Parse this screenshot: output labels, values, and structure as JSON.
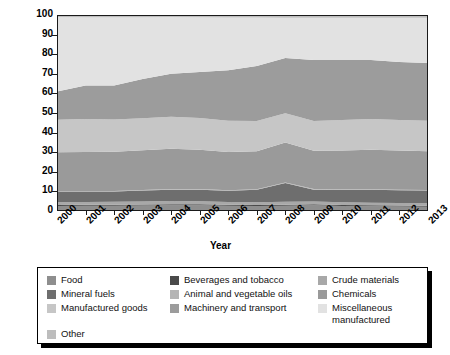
{
  "chart_data": {
    "type": "area",
    "title": "",
    "subtitle": "",
    "xlabel": "Year",
    "ylabel": "Percent",
    "grid": false,
    "legend_position": "bottom",
    "stacked": true,
    "stack_mode": "percent",
    "xlim": [
      2000,
      2013
    ],
    "ylim": [
      0,
      100
    ],
    "ytick_values": [
      0,
      10,
      20,
      30,
      40,
      50,
      60,
      70,
      80,
      90,
      100
    ],
    "ytick_labels": [
      "0",
      "10",
      "20",
      "30",
      "40",
      "50",
      "60",
      "70",
      "80",
      "90",
      "100"
    ],
    "x": [
      2000,
      2001,
      2002,
      2003,
      2004,
      2005,
      2006,
      2007,
      2008,
      2009,
      2010,
      2011,
      2012,
      2013
    ],
    "xtick_labels": [
      "2000",
      "2001",
      "2002",
      "2003",
      "2004",
      "2005",
      "2006",
      "2007",
      "2008",
      "2009",
      "2010",
      "2011",
      "2012",
      "2013"
    ],
    "series": [
      {
        "name": "Food",
        "color": "#8e8e8e",
        "values": [
          2.6,
          2.7,
          2.7,
          2.8,
          2.9,
          2.9,
          2.7,
          2.6,
          2.7,
          2.9,
          2.6,
          2.4,
          2.3,
          2.2
        ]
      },
      {
        "name": "Beverages and tobacco",
        "color": "#4a4a4a",
        "values": [
          0.5,
          0.5,
          0.5,
          0.5,
          0.5,
          0.5,
          0.5,
          0.5,
          0.5,
          0.5,
          0.5,
          0.5,
          0.5,
          0.5
        ]
      },
      {
        "name": "Crude materials",
        "color": "#a8a8a8",
        "values": [
          1.4,
          1.4,
          1.5,
          1.6,
          1.7,
          1.6,
          1.4,
          1.4,
          1.5,
          1.5,
          1.4,
          1.3,
          1.3,
          1.3
        ]
      },
      {
        "name": "Mineral fuels",
        "color": "#6e6e6e",
        "values": [
          5.4,
          5.3,
          5.2,
          5.5,
          5.8,
          5.9,
          5.7,
          6.3,
          9.6,
          6.0,
          6.3,
          6.6,
          6.5,
          6.4
        ]
      },
      {
        "name": "Animal and vegetable oils",
        "color": "#b4b4b4",
        "values": [
          0.3,
          0.3,
          0.3,
          0.3,
          0.3,
          0.3,
          0.3,
          0.3,
          0.3,
          0.3,
          0.3,
          0.3,
          0.3,
          0.3
        ]
      },
      {
        "name": "Chemicals",
        "color": "#9a9a9a",
        "values": [
          19.8,
          19.9,
          20.0,
          20.3,
          20.5,
          20.1,
          19.5,
          19.4,
          20.3,
          19.6,
          19.8,
          20.2,
          20.0,
          19.8
        ]
      },
      {
        "name": "Manufactured goods",
        "color": "#c6c6c6",
        "values": [
          16.5,
          16.8,
          16.5,
          16.3,
          16.4,
          16.2,
          15.9,
          15.4,
          15.0,
          15.1,
          15.5,
          15.6,
          15.5,
          15.5
        ]
      },
      {
        "name": "Machinery and transport",
        "color": "#9c9c9c",
        "values": [
          14.5,
          17.1,
          17.3,
          20.0,
          21.9,
          23.4,
          25.8,
          28.1,
          28.1,
          31.1,
          30.6,
          30.1,
          29.6,
          29.5
        ]
      },
      {
        "name": "Miscellaneous manufactured",
        "color": "#e2e2e2",
        "values": [
          38.0,
          34.8,
          34.8,
          31.5,
          29.0,
          27.9,
          26.9,
          24.7,
          20.6,
          21.6,
          21.6,
          21.6,
          22.6,
          23.1
        ]
      },
      {
        "name": "Other",
        "color": "#bdbdbd",
        "values": [
          1.0,
          1.2,
          1.2,
          1.2,
          1.0,
          1.2,
          1.3,
          1.3,
          1.4,
          1.4,
          1.4,
          1.4,
          1.4,
          1.4
        ]
      }
    ],
    "boundaries_note": "cumulative upper edges of each stacked band, percent"
  },
  "axes": {
    "ylabel": "Percent",
    "xlabel": "Year"
  },
  "legend": {
    "columns": 3,
    "entries": [
      {
        "label": "Food",
        "color": "#8e8e8e"
      },
      {
        "label": "Beverages and tobacco",
        "color": "#4a4a4a"
      },
      {
        "label": "Crude materials",
        "color": "#a8a8a8"
      },
      {
        "label": "Mineral fuels",
        "color": "#6e6e6e"
      },
      {
        "label": "Animal and vegetable oils",
        "color": "#b4b4b4"
      },
      {
        "label": "Chemicals",
        "color": "#9a9a9a"
      },
      {
        "label": "Manufactured goods",
        "color": "#c6c6c6"
      },
      {
        "label": "Machinery and transport",
        "color": "#9c9c9c"
      },
      {
        "label": "Miscellaneous\nmanufactured",
        "color": "#e2e2e2"
      },
      {
        "label": "Other",
        "color": "#bdbdbd"
      }
    ]
  }
}
